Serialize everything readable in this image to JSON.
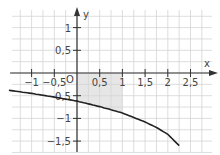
{
  "chart_data": {
    "type": "line",
    "title": "",
    "xlabel": "x",
    "ylabel": "y",
    "origin_label": "O",
    "x_ticks": [
      {
        "value": -1,
        "label": "−1"
      },
      {
        "value": -0.5,
        "label": "−0,5"
      },
      {
        "value": 0.5,
        "label": "0,5"
      },
      {
        "value": 1,
        "label": "1"
      },
      {
        "value": 1.5,
        "label": "1,5"
      },
      {
        "value": 2,
        "label": "2"
      },
      {
        "value": 2.5,
        "label": "2,5"
      }
    ],
    "y_ticks": [
      {
        "value": 1,
        "label": "1"
      },
      {
        "value": 0.5,
        "label": "0,5"
      },
      {
        "value": -0.5,
        "label": "−0,5"
      },
      {
        "value": -1,
        "label": "−1"
      },
      {
        "value": -1.5,
        "label": "−1,5"
      }
    ],
    "xlim": [
      -1.5,
      3.0
    ],
    "ylim": [
      -1.75,
      1.4
    ],
    "grid": true,
    "grid_step": 0.25,
    "series": [
      {
        "name": "curve",
        "color": "#222222",
        "x": [
          -1.5,
          -1.0,
          -0.5,
          0,
          0.5,
          1.0,
          1.5,
          1.75,
          2.0,
          2.25
        ],
        "y": [
          -0.38,
          -0.45,
          -0.53,
          -0.62,
          -0.74,
          -0.88,
          -1.08,
          -1.2,
          -1.35,
          -1.6
        ]
      }
    ],
    "shaded_region": {
      "description": "area between x-axis and curve for 0 ≤ x ≤ 1",
      "x_from": 0,
      "x_to": 1,
      "color": "#e6e6e6"
    }
  }
}
